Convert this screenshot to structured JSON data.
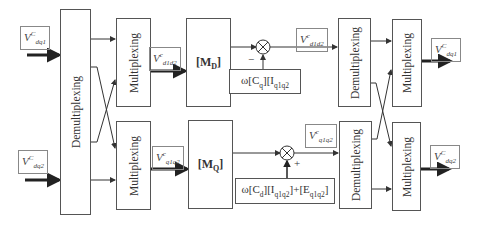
{
  "diagram": {
    "blocks": {
      "demux_left": {
        "label": "Demultiplexing"
      },
      "mux_top": {
        "label": "Multiplexing"
      },
      "mux_bottom": {
        "label": "Multiplexing"
      },
      "md": {
        "label": "[M",
        "sub": "D",
        "tail": "]"
      },
      "mq": {
        "label": "[M",
        "sub": "Q",
        "tail": "]"
      },
      "demux_right_top": {
        "label": "Demultiplexing"
      },
      "demux_right_bottom": {
        "label": "Demultiplexing"
      },
      "mux_out_top": {
        "label": "Multiplexing"
      },
      "mux_out_bottom": {
        "label": "Multiplexing"
      },
      "feedback_top": {
        "label": "ω[C",
        "sub1": "q",
        "mid": "][I",
        "sub2": "q1q2"
      },
      "feedback_bottom": {
        "label": "ω[C",
        "sub1": "d",
        "mid1": "][I",
        "sub2": "q1q2",
        "mid2": "]+[E",
        "sub3": "q1q2",
        "tail": "]"
      }
    },
    "signals": {
      "in1": {
        "base": "V",
        "sup": "C",
        "sub": "dq1"
      },
      "in2": {
        "base": "V",
        "sup": "C",
        "sub": "dq2"
      },
      "vd_mid": {
        "base": "V",
        "sup": "c",
        "sub": "d1d2"
      },
      "vq_mid": {
        "base": "V",
        "sup": "c",
        "sub": "q1q2"
      },
      "vd_out": {
        "base": "V",
        "sup": "c",
        "sub": "d1d2"
      },
      "vq_out": {
        "base": "V",
        "sup": "c",
        "sub": "q1q2"
      },
      "out1": {
        "base": "V",
        "sup": "C",
        "sub": "dq1"
      },
      "out2": {
        "base": "V",
        "sup": "C",
        "sub": "dq2"
      }
    },
    "summing_signs": {
      "top": "−",
      "bottom": "+"
    }
  }
}
